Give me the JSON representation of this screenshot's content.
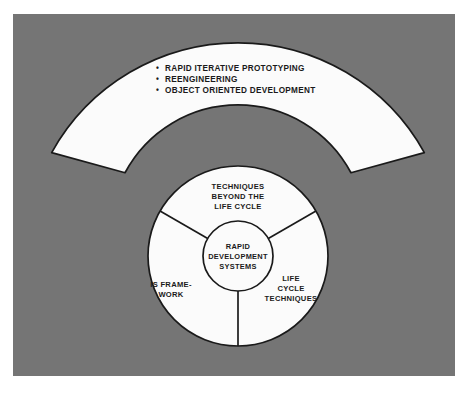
{
  "figure": {
    "background_color": "#757575",
    "shape_fill": "#fbfbfb",
    "stroke_color": "#1a1a1a",
    "page_color": "#ffffff"
  },
  "fan": {
    "name": "outer-fan-band",
    "bullets": [
      {
        "marker": "•",
        "label": "RAPID ITERATIVE PROTOTYPING"
      },
      {
        "marker": "•",
        "label": "REENGINEERING"
      },
      {
        "marker": "•",
        "label": "OBJECT ORIENTED DEVELOPMENT"
      }
    ]
  },
  "wheel": {
    "core": {
      "name": "rapid-development-systems-core",
      "lines": [
        "RAPID",
        "DEVELOPMENT",
        "SYSTEMS"
      ]
    },
    "sectors": [
      {
        "name": "techniques-beyond-the-life-cycle",
        "lines": [
          "TECHNIQUES",
          "BEYOND THE",
          "LIFE CYCLE"
        ]
      },
      {
        "name": "life-cycle-techniques",
        "lines": [
          "LIFE",
          "CYCLE",
          "TECHNIQUES"
        ]
      },
      {
        "name": "is-framework",
        "lines": [
          "IS FRAME-",
          "WORK"
        ]
      }
    ]
  }
}
